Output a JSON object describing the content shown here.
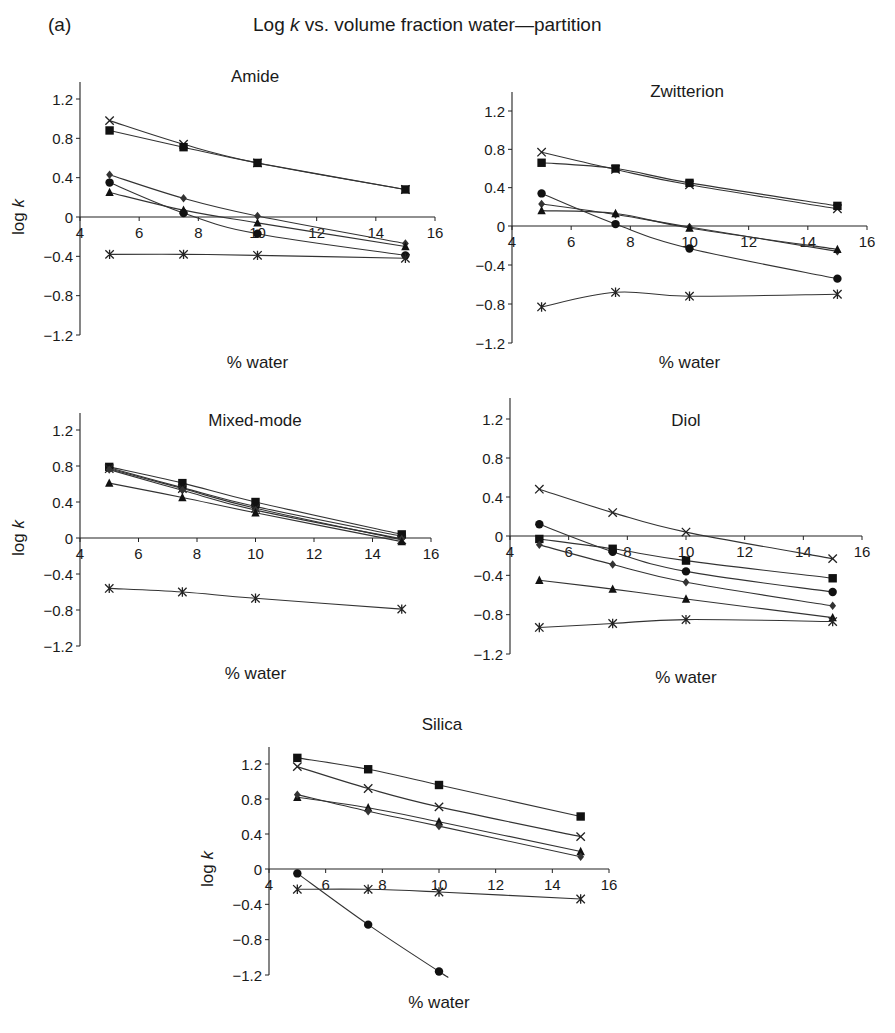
{
  "figure": {
    "panel_label": "(a)",
    "title_prefix": "Log ",
    "title_italic": "k",
    "title_suffix": " vs. volume fraction water—partition"
  },
  "chart_data": [
    {
      "type": "line",
      "title": "Amide",
      "xlabel": "% water",
      "ylabel": "log k",
      "xlim": [
        4,
        16
      ],
      "ylim": [
        -1.2,
        1.2
      ],
      "xticks": [
        4,
        6,
        8,
        10,
        12,
        14,
        16
      ],
      "yticks": [
        1.2,
        0.8,
        0.4,
        0,
        -0.4,
        -0.8,
        -1.2
      ],
      "grid": false,
      "x": [
        5,
        7.5,
        10,
        15
      ],
      "series": [
        {
          "marker": "cross",
          "values": [
            0.98,
            0.74,
            0.55,
            0.28
          ]
        },
        {
          "marker": "square",
          "values": [
            0.88,
            0.71,
            0.55,
            0.28
          ]
        },
        {
          "marker": "diamond",
          "values": [
            0.43,
            0.19,
            0.01,
            -0.27
          ]
        },
        {
          "marker": "circle",
          "values": [
            0.35,
            0.04,
            -0.17,
            -0.39
          ]
        },
        {
          "marker": "triangle",
          "values": [
            0.25,
            0.07,
            -0.06,
            -0.3
          ]
        },
        {
          "marker": "asterisk",
          "values": [
            -0.38,
            -0.38,
            -0.39,
            -0.42
          ]
        }
      ]
    },
    {
      "type": "line",
      "title": "Zwitterion",
      "xlabel": "% water",
      "ylabel": "",
      "xlim": [
        4,
        16
      ],
      "ylim": [
        -1.2,
        1.2
      ],
      "xticks": [
        4,
        6,
        8,
        10,
        12,
        14,
        16
      ],
      "yticks": [
        1.2,
        0.8,
        0.4,
        0,
        -0.4,
        -0.8,
        -1.2
      ],
      "grid": false,
      "x": [
        5,
        7.5,
        10,
        15
      ],
      "series": [
        {
          "marker": "cross",
          "values": [
            0.77,
            0.59,
            0.43,
            0.18
          ]
        },
        {
          "marker": "square",
          "values": [
            0.66,
            0.6,
            0.45,
            0.21
          ]
        },
        {
          "marker": "diamond",
          "values": [
            0.23,
            0.12,
            -0.01,
            -0.26
          ]
        },
        {
          "marker": "circle",
          "values": [
            0.34,
            0.02,
            -0.23,
            -0.54
          ]
        },
        {
          "marker": "triangle",
          "values": [
            0.16,
            0.13,
            -0.02,
            -0.24
          ]
        },
        {
          "marker": "asterisk",
          "values": [
            -0.83,
            -0.68,
            -0.72,
            -0.7
          ]
        }
      ]
    },
    {
      "type": "line",
      "title": "Mixed-mode",
      "xlabel": "% water",
      "ylabel": "log k",
      "xlim": [
        4,
        16
      ],
      "ylim": [
        -1.2,
        1.2
      ],
      "xticks": [
        4,
        6,
        8,
        10,
        12,
        14,
        16
      ],
      "yticks": [
        1.2,
        0.8,
        0.4,
        0,
        -0.4,
        -0.8,
        -1.2
      ],
      "grid": false,
      "x": [
        5,
        7.5,
        10,
        15
      ],
      "series": [
        {
          "marker": "square",
          "values": [
            0.79,
            0.61,
            0.4,
            0.04
          ]
        },
        {
          "marker": "circle",
          "values": [
            0.78,
            0.56,
            0.35,
            0.02
          ]
        },
        {
          "marker": "cross",
          "values": [
            0.77,
            0.55,
            0.33,
            -0.02
          ]
        },
        {
          "marker": "diamond",
          "values": [
            0.76,
            0.53,
            0.31,
            -0.01
          ]
        },
        {
          "marker": "triangle",
          "values": [
            0.61,
            0.45,
            0.28,
            -0.04
          ]
        },
        {
          "marker": "asterisk",
          "values": [
            -0.56,
            -0.6,
            -0.67,
            -0.79
          ]
        }
      ]
    },
    {
      "type": "line",
      "title": "Diol",
      "xlabel": "% water",
      "ylabel": "",
      "xlim": [
        4,
        16
      ],
      "ylim": [
        -1.2,
        1.2
      ],
      "xticks": [
        4,
        6,
        8,
        10,
        12,
        14,
        16
      ],
      "yticks": [
        1.2,
        0.8,
        0.4,
        0,
        -0.4,
        -0.8,
        -1.2
      ],
      "grid": false,
      "x": [
        5,
        7.5,
        10,
        15
      ],
      "series": [
        {
          "marker": "cross",
          "values": [
            0.48,
            0.24,
            0.04,
            -0.23
          ]
        },
        {
          "marker": "square",
          "values": [
            -0.03,
            -0.13,
            -0.25,
            -0.43
          ]
        },
        {
          "marker": "circle",
          "values": [
            0.12,
            -0.16,
            -0.36,
            -0.57
          ]
        },
        {
          "marker": "diamond",
          "values": [
            -0.09,
            -0.29,
            -0.47,
            -0.71
          ]
        },
        {
          "marker": "triangle",
          "values": [
            -0.45,
            -0.54,
            -0.64,
            -0.83
          ]
        },
        {
          "marker": "asterisk",
          "values": [
            -0.93,
            -0.89,
            -0.85,
            -0.87
          ]
        }
      ]
    },
    {
      "type": "line",
      "title": "Silica",
      "xlabel": "% water",
      "ylabel": "log k",
      "xlim": [
        4,
        16
      ],
      "ylim": [
        -1.2,
        1.2
      ],
      "xticks": [
        4,
        6,
        8,
        10,
        12,
        14,
        16
      ],
      "yticks": [
        1.2,
        0.8,
        0.4,
        0,
        -0.4,
        -0.8,
        -1.2
      ],
      "grid": false,
      "x": [
        5,
        7.5,
        10,
        15
      ],
      "series": [
        {
          "marker": "square",
          "values": [
            1.27,
            1.14,
            0.96,
            0.6
          ]
        },
        {
          "marker": "cross",
          "values": [
            1.17,
            0.92,
            0.71,
            0.37
          ]
        },
        {
          "marker": "triangle",
          "values": [
            0.82,
            0.7,
            0.54,
            0.2
          ]
        },
        {
          "marker": "diamond",
          "values": [
            0.85,
            0.66,
            0.49,
            0.14
          ]
        },
        {
          "marker": "circle",
          "values": [
            -0.05,
            -0.63,
            -1.16,
            null
          ],
          "trend_end": [
            10.3,
            -1.22
          ]
        },
        {
          "marker": "asterisk",
          "values": [
            -0.23,
            -0.23,
            -0.26,
            -0.34
          ]
        }
      ]
    }
  ],
  "layout": {
    "panels": [
      {
        "x0": 80,
        "x1": 435,
        "y_top": 99,
        "y_zero": 217,
        "y_bot": 335,
        "axis_top": 82,
        "title_x": 255,
        "title_y": 82,
        "xlabel_y": 368,
        "ylabel_x": 24
      },
      {
        "x0": 512,
        "x1": 867,
        "y_top": 111,
        "y_zero": 226,
        "y_bot": 343,
        "axis_top": 92,
        "title_x": 687,
        "title_y": 97,
        "xlabel_y": 368,
        "ylabel_x": null
      },
      {
        "x0": 80,
        "x1": 431,
        "y_top": 430,
        "y_zero": 538,
        "y_bot": 646,
        "axis_top": 413,
        "title_x": 255,
        "title_y": 426,
        "xlabel_y": 679,
        "ylabel_x": 24
      },
      {
        "x0": 510,
        "x1": 862,
        "y_top": 419,
        "y_zero": 536,
        "y_bot": 654,
        "axis_top": 398,
        "title_x": 686,
        "title_y": 426,
        "xlabel_y": 683,
        "ylabel_x": null
      },
      {
        "x0": 269,
        "x1": 609,
        "y_top": 764,
        "y_zero": 869,
        "y_bot": 975,
        "axis_top": 747,
        "title_x": 442,
        "title_y": 730,
        "xlabel_y": 1008,
        "ylabel_x": 213
      }
    ]
  }
}
